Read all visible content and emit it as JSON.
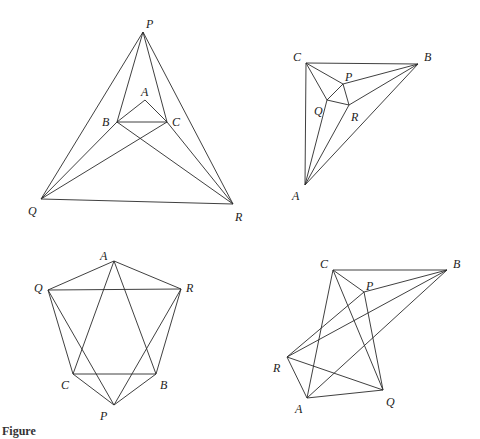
{
  "caption": "Figure",
  "figures": [
    {
      "id": "fig1",
      "points": {
        "P": [
          143,
          32
        ],
        "A": [
          145,
          100
        ],
        "B": [
          117,
          122
        ],
        "C": [
          167,
          122
        ],
        "Q": [
          41,
          199
        ],
        "R": [
          233,
          204
        ]
      },
      "labels": {
        "P": [
          146,
          28
        ],
        "A": [
          141,
          96
        ],
        "B": [
          102,
          126
        ],
        "C": [
          172,
          126
        ],
        "Q": [
          28,
          215
        ],
        "R": [
          235,
          221
        ]
      },
      "edges": [
        [
          "P",
          "Q"
        ],
        [
          "P",
          "R"
        ],
        [
          "Q",
          "R"
        ],
        [
          "P",
          "B"
        ],
        [
          "P",
          "C"
        ],
        [
          "Q",
          "B"
        ],
        [
          "Q",
          "C"
        ],
        [
          "R",
          "B"
        ],
        [
          "R",
          "C"
        ],
        [
          "A",
          "B"
        ],
        [
          "A",
          "C"
        ],
        [
          "B",
          "C"
        ]
      ]
    },
    {
      "id": "fig2",
      "points": {
        "C": [
          306,
          63
        ],
        "B": [
          418,
          64
        ],
        "P": [
          343,
          84
        ],
        "Q": [
          327,
          100
        ],
        "R": [
          349,
          105
        ],
        "A": [
          305,
          185
        ]
      },
      "labels": {
        "C": [
          293,
          61
        ],
        "B": [
          424,
          61
        ],
        "P": [
          345,
          81
        ],
        "Q": [
          314,
          115
        ],
        "R": [
          351,
          121
        ],
        "A": [
          292,
          200
        ]
      },
      "edges": [
        [
          "C",
          "B"
        ],
        [
          "C",
          "A"
        ],
        [
          "A",
          "B"
        ],
        [
          "C",
          "P"
        ],
        [
          "P",
          "B"
        ],
        [
          "C",
          "Q"
        ],
        [
          "Q",
          "A"
        ],
        [
          "A",
          "R"
        ],
        [
          "R",
          "B"
        ],
        [
          "P",
          "Q"
        ],
        [
          "Q",
          "R"
        ],
        [
          "P",
          "R"
        ]
      ]
    },
    {
      "id": "fig3",
      "points": {
        "A": [
          114,
          261
        ],
        "Q": [
          48,
          290
        ],
        "R": [
          181,
          289
        ],
        "C": [
          73,
          374
        ],
        "B": [
          156,
          374
        ],
        "P": [
          114,
          405
        ]
      },
      "labels": {
        "A": [
          100,
          260
        ],
        "Q": [
          34,
          292
        ],
        "R": [
          186,
          292
        ],
        "C": [
          61,
          389
        ],
        "B": [
          160,
          389
        ],
        "P": [
          100,
          420
        ]
      },
      "edges": [
        [
          "A",
          "Q"
        ],
        [
          "A",
          "R"
        ],
        [
          "Q",
          "R"
        ],
        [
          "A",
          "C"
        ],
        [
          "A",
          "B"
        ],
        [
          "Q",
          "C"
        ],
        [
          "Q",
          "P"
        ],
        [
          "R",
          "B"
        ],
        [
          "R",
          "P"
        ],
        [
          "C",
          "B"
        ],
        [
          "C",
          "P"
        ],
        [
          "B",
          "P"
        ]
      ]
    },
    {
      "id": "fig4",
      "points": {
        "C": [
          333,
          270
        ],
        "B": [
          447,
          270
        ],
        "P": [
          364,
          292
        ],
        "R": [
          287,
          357
        ],
        "A": [
          307,
          398
        ],
        "Q": [
          383,
          390
        ]
      },
      "labels": {
        "C": [
          320,
          268
        ],
        "B": [
          453,
          268
        ],
        "P": [
          366,
          290
        ],
        "R": [
          273,
          372
        ],
        "A": [
          295,
          413
        ],
        "Q": [
          386,
          406
        ]
      },
      "edges": [
        [
          "C",
          "B"
        ],
        [
          "C",
          "P"
        ],
        [
          "P",
          "B"
        ],
        [
          "C",
          "A"
        ],
        [
          "C",
          "Q"
        ],
        [
          "P",
          "Q"
        ],
        [
          "R",
          "P"
        ],
        [
          "R",
          "B"
        ],
        [
          "R",
          "A"
        ],
        [
          "R",
          "Q"
        ],
        [
          "A",
          "Q"
        ],
        [
          "A",
          "B"
        ]
      ]
    }
  ]
}
